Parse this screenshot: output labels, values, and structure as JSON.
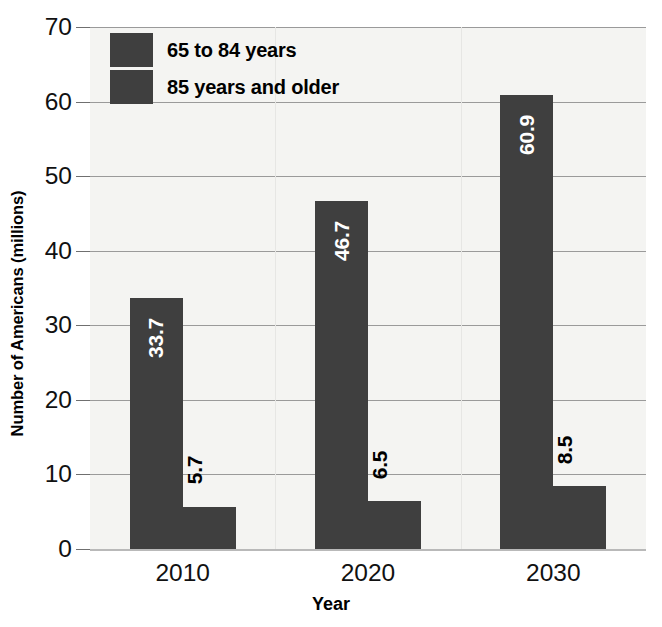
{
  "chart_data": {
    "type": "bar",
    "title": "",
    "subtitle": "",
    "xlabel": "Year",
    "ylabel": "Number of Americans (millions)",
    "categories": [
      "2010",
      "2020",
      "2030"
    ],
    "series": [
      {
        "name": "65 to 84 years",
        "values": [
          33.7,
          46.7,
          60.9
        ],
        "color": "#3f3f3f"
      },
      {
        "name": "85 years and older",
        "values": [
          5.7,
          6.5,
          8.5
        ],
        "color": "#3f3f3f"
      }
    ],
    "ylim": [
      0,
      70
    ],
    "yticks": [
      0,
      10,
      20,
      30,
      40,
      50,
      60,
      70
    ],
    "ytick_labels": [
      "0",
      "10",
      "20",
      "30",
      "40",
      "50",
      "60",
      "70"
    ],
    "grid": true,
    "grid_axis": "y",
    "legend_position": "top-left",
    "data_labels": {
      "rotation": 90,
      "series_1": [
        "33.7",
        "46.7",
        "60.9"
      ],
      "series_2": [
        "5.7",
        "6.5",
        "8.5"
      ]
    },
    "background_color": "#f4f4f2",
    "bar_color": "#3f3f3f",
    "inside_label_color": "#ffffff",
    "outside_label_color": "#000000"
  },
  "legend": {
    "items": [
      {
        "label": "65 to 84 years"
      },
      {
        "label": "85 years and older"
      }
    ]
  },
  "axes": {
    "y_title": "Number of Americans (millions)",
    "x_title": "Year",
    "y_labels": [
      "70",
      "60",
      "50",
      "40",
      "30",
      "20",
      "10",
      "0"
    ],
    "x_labels": [
      "2010",
      "2020",
      "2030"
    ]
  }
}
